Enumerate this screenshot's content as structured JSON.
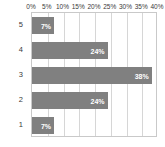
{
  "chart_data": {
    "type": "bar",
    "orientation": "horizontal",
    "title": "",
    "subtitle": "",
    "xlabel": "",
    "ylabel": "",
    "categories": [
      "5",
      "4",
      "3",
      "2",
      "1"
    ],
    "values": [
      7,
      24,
      38,
      24,
      7
    ],
    "value_labels": [
      "7%",
      "24%",
      "38%",
      "24%",
      "7%"
    ],
    "xlim": [
      0,
      40
    ],
    "xticks": [
      0,
      5,
      10,
      15,
      20,
      25,
      30,
      35,
      40
    ],
    "xtick_labels": [
      "0%",
      "5%",
      "10%",
      "15%",
      "20%",
      "25%",
      "30%",
      "35%",
      "40%"
    ],
    "xaxis_position": "top",
    "grid": true,
    "grid_axis": "x",
    "legend": false,
    "series": [
      {
        "name": "",
        "values": [
          7,
          24,
          38,
          24,
          7
        ]
      }
    ]
  },
  "style": {
    "bar_color": "#808080",
    "bar_label_color": "#ffffff",
    "grid_color": "#d6d6d6",
    "frame_color": "#c9c9c9",
    "background": "#ffffff",
    "tick_label_color": "#3a3a3a"
  }
}
